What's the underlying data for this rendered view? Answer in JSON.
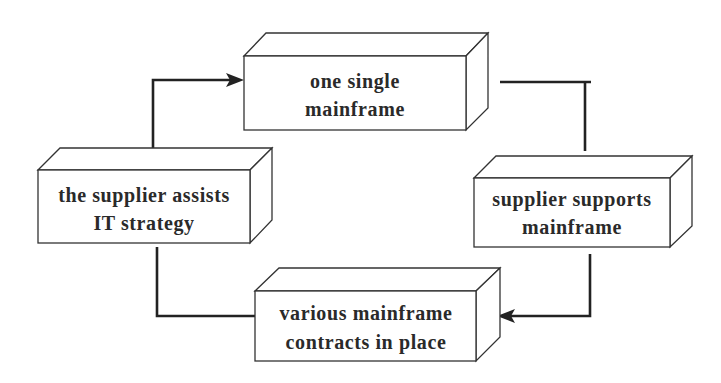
{
  "diagram": {
    "type": "cycle",
    "nodes": [
      {
        "id": "top",
        "lines": [
          "one single",
          "mainframe"
        ]
      },
      {
        "id": "right",
        "lines": [
          "supplier supports",
          "mainframe"
        ]
      },
      {
        "id": "bottom",
        "lines": [
          "various mainframe",
          "contracts in place"
        ]
      },
      {
        "id": "left",
        "lines": [
          "the supplier assists",
          "IT strategy"
        ]
      }
    ],
    "edges": [
      {
        "from": "top",
        "to": "right",
        "arrow": false
      },
      {
        "from": "right",
        "to": "bottom",
        "arrow": true
      },
      {
        "from": "bottom",
        "to": "left",
        "arrow": false
      },
      {
        "from": "left",
        "to": "top",
        "arrow": true
      }
    ],
    "colors": {
      "stroke": "#333333",
      "text": "#2a2a2a",
      "background": "#ffffff"
    }
  }
}
